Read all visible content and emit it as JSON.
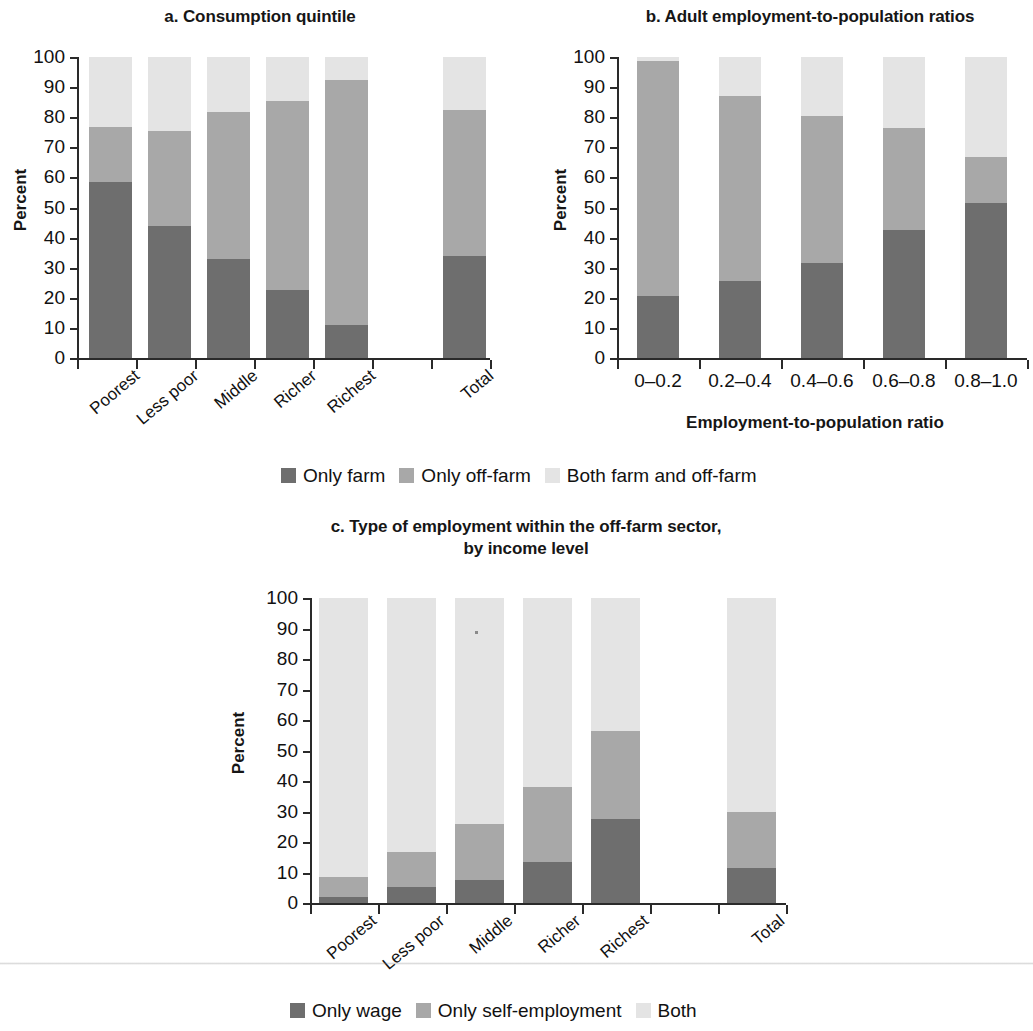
{
  "figure": {
    "panels": [
      {
        "id": "a",
        "title": "a. Consumption quintile",
        "ylabel": "Percent",
        "xlabel": ""
      },
      {
        "id": "b",
        "title": "b. Adult employment-to-population ratios",
        "ylabel": "Percent",
        "xlabel": "Employment-to-population ratio"
      },
      {
        "id": "c",
        "title_line1": "c. Type of employment within the off-farm sector,",
        "title_line2": "by income level",
        "ylabel": "Percent",
        "xlabel": ""
      }
    ],
    "legend_ab": {
      "items": [
        {
          "label": "Only farm",
          "color": "#6e6e6e"
        },
        {
          "label": "Only off-farm",
          "color": "#a8a8a8"
        },
        {
          "label": "Both farm and off-farm",
          "color": "#e4e4e4"
        }
      ]
    },
    "legend_c": {
      "items": [
        {
          "label": "Only wage",
          "color": "#6e6e6e"
        },
        {
          "label": "Only self-employment",
          "color": "#a8a8a8"
        },
        {
          "label": "Both",
          "color": "#e4e4e4"
        }
      ]
    },
    "yticks": [
      "100",
      "90",
      "80",
      "70",
      "60",
      "50",
      "40",
      "30",
      "20",
      "10",
      "0"
    ]
  },
  "chart_data": [
    {
      "type": "bar",
      "stacked": true,
      "panel": "a",
      "title": "a. Consumption quintile",
      "xlabel": "",
      "ylabel": "Percent",
      "ylim": [
        0,
        100
      ],
      "ytick_values": [
        0,
        10,
        20,
        30,
        40,
        50,
        60,
        70,
        80,
        90,
        100
      ],
      "grid": false,
      "legend_position": "below-figure",
      "categories": [
        "Poorest",
        "Less poor",
        "Middle",
        "Richer",
        "Richest",
        "",
        "Total"
      ],
      "category_has_bar": [
        true,
        true,
        true,
        true,
        true,
        false,
        true
      ],
      "series": [
        {
          "name": "Only farm",
          "color": "#6e6e6e",
          "values": [
            58.5,
            44.0,
            33.0,
            22.5,
            11.0,
            null,
            34.0
          ]
        },
        {
          "name": "Only off-farm",
          "color": "#a8a8a8",
          "values": [
            18.2,
            31.3,
            48.8,
            63.0,
            81.5,
            null,
            48.3
          ]
        },
        {
          "name": "Both farm and off-farm",
          "color": "#e4e4e4",
          "values": [
            23.3,
            24.7,
            18.2,
            14.5,
            7.5,
            null,
            17.7
          ]
        }
      ],
      "segment_tops": {
        "Only farm": [
          58.5,
          44.0,
          33.0,
          22.5,
          11.0,
          null,
          34.0
        ],
        "Only off-farm": [
          76.7,
          75.3,
          81.8,
          85.5,
          92.5,
          null,
          82.3
        ],
        "Both farm and off-farm": [
          100,
          100,
          100,
          100,
          100,
          null,
          100
        ]
      }
    },
    {
      "type": "bar",
      "stacked": true,
      "panel": "b",
      "title": "b. Adult employment-to-population ratios",
      "xlabel": "Employment-to-population ratio",
      "ylabel": "Percent",
      "ylim": [
        0,
        100
      ],
      "ytick_values": [
        0,
        10,
        20,
        30,
        40,
        50,
        60,
        70,
        80,
        90,
        100
      ],
      "grid": false,
      "legend_position": "below-figure",
      "categories": [
        "0–0.2",
        "0.2–0.4",
        "0.4–0.6",
        "0.6–0.8",
        "0.8–1.0"
      ],
      "category_has_bar": [
        true,
        true,
        true,
        true,
        true
      ],
      "series": [
        {
          "name": "Only farm",
          "color": "#6e6e6e",
          "values": [
            20.5,
            25.7,
            31.4,
            42.6,
            51.4
          ]
        },
        {
          "name": "Only off-farm",
          "color": "#a8a8a8",
          "values": [
            78.3,
            61.2,
            49.1,
            33.7,
            15.3
          ]
        },
        {
          "name": "Both farm and off-farm",
          "color": "#e4e4e4",
          "values": [
            1.2,
            13.1,
            19.5,
            23.7,
            33.3
          ]
        }
      ],
      "segment_tops": {
        "Only farm": [
          20.5,
          25.7,
          31.4,
          42.6,
          51.4
        ],
        "Only off-farm": [
          98.8,
          86.9,
          80.5,
          76.3,
          66.7
        ],
        "Both farm and off-farm": [
          100,
          100,
          100,
          100,
          100
        ]
      }
    },
    {
      "type": "bar",
      "stacked": true,
      "panel": "c",
      "title": "c. Type of employment within the off-farm sector, by income level",
      "xlabel": "",
      "ylabel": "Percent",
      "ylim": [
        0,
        100
      ],
      "ytick_values": [
        0,
        10,
        20,
        30,
        40,
        50,
        60,
        70,
        80,
        90,
        100
      ],
      "grid": false,
      "legend_position": "below-figure",
      "categories": [
        "Poorest",
        "Less poor",
        "Middle",
        "Richer",
        "Richest",
        "",
        "Total"
      ],
      "category_has_bar": [
        true,
        true,
        true,
        true,
        true,
        false,
        true
      ],
      "series": [
        {
          "name": "Only wage",
          "color": "#6e6e6e",
          "values": [
            2.0,
            5.2,
            7.6,
            13.3,
            27.5,
            null,
            11.5
          ]
        },
        {
          "name": "Only self-employment",
          "color": "#a8a8a8",
          "values": [
            6.6,
            11.6,
            18.3,
            24.8,
            29.0,
            null,
            18.2
          ]
        },
        {
          "name": "Both",
          "color": "#e4e4e4",
          "values": [
            91.4,
            83.2,
            74.1,
            61.9,
            43.5,
            null,
            70.3
          ]
        }
      ],
      "segment_tops": {
        "Only wage": [
          2.0,
          5.2,
          7.6,
          13.3,
          27.5,
          null,
          11.5
        ],
        "Only self-employment": [
          8.6,
          16.8,
          25.9,
          38.1,
          56.5,
          null,
          29.7
        ],
        "Both": [
          100,
          100,
          100,
          100,
          100,
          null,
          100
        ]
      }
    }
  ]
}
